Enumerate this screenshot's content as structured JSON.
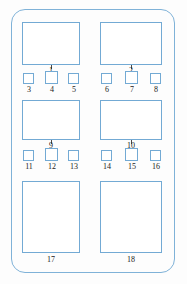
{
  "diagram": {
    "shape": "rounded-rectangle-enclosure",
    "colors": {
      "outline": "#7FB2D8",
      "box_outline": "#73AAD4",
      "label_text": "#1a1a1a",
      "background": "#ffffff"
    },
    "enclosure": {
      "label": "outer-enclosure"
    },
    "large_boxes": [
      {
        "id": "1",
        "label": "1",
        "column": "left",
        "row": "top",
        "x": 22,
        "y": 22,
        "w": 58,
        "h": 43
      },
      {
        "id": "2",
        "label": "2",
        "column": "right",
        "row": "top",
        "x": 100,
        "y": 22,
        "w": 62,
        "h": 43
      },
      {
        "id": "9",
        "label": "9",
        "column": "left",
        "row": "middle",
        "x": 22,
        "y": 100,
        "w": 58,
        "h": 40
      },
      {
        "id": "10",
        "label": "10",
        "column": "right",
        "row": "middle",
        "x": 100,
        "y": 100,
        "w": 62,
        "h": 40
      },
      {
        "id": "17",
        "label": "17",
        "column": "left",
        "row": "bottom",
        "x": 22,
        "y": 181,
        "w": 58,
        "h": 72
      },
      {
        "id": "18",
        "label": "18",
        "column": "right",
        "row": "bottom",
        "x": 100,
        "y": 181,
        "w": 62,
        "h": 72
      }
    ],
    "small_squares": [
      {
        "id": "3",
        "label": "3",
        "column": "left",
        "row": "upper",
        "x": 23,
        "y": 73,
        "w": 11,
        "h": 11
      },
      {
        "id": "4",
        "label": "4",
        "column": "left",
        "row": "upper",
        "x": 45,
        "y": 72,
        "w": 13,
        "h": 13
      },
      {
        "id": "5",
        "label": "5",
        "column": "left",
        "row": "upper",
        "x": 68,
        "y": 73,
        "w": 11,
        "h": 11
      },
      {
        "id": "6",
        "label": "6",
        "column": "right",
        "row": "upper",
        "x": 101,
        "y": 73,
        "w": 11,
        "h": 11
      },
      {
        "id": "7",
        "label": "7",
        "column": "right",
        "row": "upper",
        "x": 125,
        "y": 72,
        "w": 13,
        "h": 13
      },
      {
        "id": "8",
        "label": "8",
        "column": "right",
        "row": "upper",
        "x": 150,
        "y": 73,
        "w": 11,
        "h": 11
      },
      {
        "id": "11",
        "label": "11",
        "column": "left",
        "row": "lower",
        "x": 23,
        "y": 150,
        "w": 11,
        "h": 11
      },
      {
        "id": "12",
        "label": "12",
        "column": "left",
        "row": "lower",
        "x": 45,
        "y": 149,
        "w": 13,
        "h": 13
      },
      {
        "id": "13",
        "label": "13",
        "column": "left",
        "row": "lower",
        "x": 68,
        "y": 150,
        "w": 11,
        "h": 11
      },
      {
        "id": "14",
        "label": "14",
        "column": "right",
        "row": "lower",
        "x": 101,
        "y": 150,
        "w": 11,
        "h": 11
      },
      {
        "id": "15",
        "label": "15",
        "column": "right",
        "row": "lower",
        "x": 125,
        "y": 149,
        "w": 13,
        "h": 13
      },
      {
        "id": "16",
        "label": "16",
        "column": "right",
        "row": "lower",
        "x": 150,
        "y": 150,
        "w": 11,
        "h": 11
      }
    ],
    "labels": {
      "l1": "1",
      "l2": "2",
      "l3": "3",
      "l4": "4",
      "l5": "5",
      "l6": "6",
      "l7": "7",
      "l8": "8",
      "l9": "9",
      "l10": "10",
      "l11": "11",
      "l12": "12",
      "l13": "13",
      "l14": "14",
      "l15": "15",
      "l16": "16",
      "l17": "17",
      "l18": "18"
    }
  }
}
